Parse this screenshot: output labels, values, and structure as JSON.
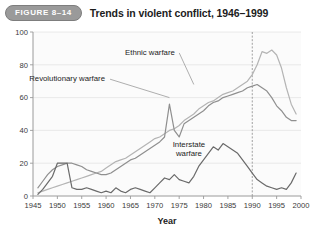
{
  "header": {
    "badge": "FIGURE 8–14",
    "title": "Trends in violent conflict, 1946–1999"
  },
  "chart_data": {
    "type": "line",
    "title": "Trends in violent conflict, 1946–1999",
    "xlabel": "Year",
    "ylabel": "",
    "xlim": [
      1945,
      2000
    ],
    "ylim": [
      0,
      100
    ],
    "yticks": [
      0,
      20,
      40,
      60,
      80,
      100
    ],
    "xticks": [
      1945,
      1950,
      1955,
      1960,
      1965,
      1970,
      1975,
      1980,
      1985,
      1990,
      1995,
      2000
    ],
    "grid": true,
    "legend": "inline-annotations",
    "annotations": [
      {
        "text": "Ethnic warfare",
        "x": 1969,
        "y": 86,
        "leader_to": {
          "x": 1978,
          "y": 68
        }
      },
      {
        "text": "Revolutionary warfare",
        "x": 1952,
        "y": 70,
        "leader_to": {
          "x": 1973,
          "y": 60
        }
      },
      {
        "text": "Interstate warfare",
        "x": 1977,
        "y": 30,
        "leader_to": {
          "x": 1977,
          "y": 22
        }
      }
    ],
    "reference_line": {
      "x": 1990,
      "style": "dashed",
      "color": "#8a8a8a"
    },
    "colors": {
      "ethnic": "#b4b4b4",
      "revolutionary": "#8f8f8f",
      "interstate": "#6a6a6a"
    },
    "x": [
      1946,
      1947,
      1948,
      1949,
      1950,
      1951,
      1952,
      1953,
      1954,
      1955,
      1956,
      1957,
      1958,
      1959,
      1960,
      1961,
      1962,
      1963,
      1964,
      1965,
      1966,
      1967,
      1968,
      1969,
      1970,
      1971,
      1972,
      1973,
      1974,
      1975,
      1976,
      1977,
      1978,
      1979,
      1980,
      1981,
      1982,
      1983,
      1984,
      1985,
      1986,
      1987,
      1988,
      1989,
      1990,
      1991,
      1992,
      1993,
      1994,
      1995,
      1996,
      1997,
      1998,
      1999
    ],
    "series": [
      {
        "name": "Ethnic warfare",
        "color": "#b4b4b4",
        "values": [
          2,
          3,
          4,
          5,
          6,
          7,
          8,
          9,
          10,
          11,
          12,
          13,
          14,
          15,
          17,
          19,
          21,
          22,
          23,
          25,
          27,
          29,
          31,
          33,
          35,
          36,
          38,
          40,
          41,
          43,
          46,
          48,
          50,
          53,
          55,
          57,
          58,
          60,
          62,
          63,
          64,
          66,
          68,
          70,
          74,
          80,
          88,
          87,
          89,
          86,
          78,
          66,
          56,
          50
        ]
      },
      {
        "name": "Revolutionary warfare",
        "color": "#8f8f8f",
        "values": [
          5,
          9,
          13,
          16,
          18,
          19,
          20,
          20,
          19,
          18,
          16,
          15,
          14,
          13,
          13,
          14,
          16,
          18,
          20,
          22,
          23,
          25,
          27,
          29,
          31,
          33,
          36,
          56,
          40,
          36,
          44,
          46,
          48,
          50,
          52,
          55,
          57,
          58,
          60,
          61,
          62,
          63,
          64,
          66,
          67,
          68,
          66,
          64,
          60,
          55,
          52,
          48,
          46,
          46
        ]
      },
      {
        "name": "Interstate warfare",
        "color": "#6a6a6a"
      }
    ],
    "series_data_interstate": [
      1,
      4,
      8,
      12,
      20,
      20,
      20,
      5,
      4,
      4,
      5,
      4,
      3,
      2,
      3,
      2,
      5,
      3,
      2,
      4,
      5,
      4,
      3,
      2,
      5,
      8,
      11,
      10,
      13,
      10,
      9,
      8,
      12,
      18,
      22,
      26,
      30,
      28,
      32,
      30,
      28,
      26,
      22,
      18,
      14,
      10,
      8,
      6,
      5,
      4,
      5,
      4,
      8,
      14
    ]
  }
}
